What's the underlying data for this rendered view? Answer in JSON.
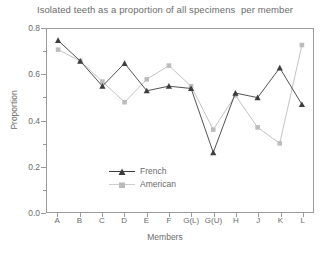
{
  "chart_data": {
    "type": "line",
    "title": "Isolated teeth as a proportion of all specimens  per member",
    "xlabel": "Members",
    "ylabel": "Proportion",
    "categories": [
      "A",
      "B",
      "C",
      "D",
      "E",
      "F",
      "G(L)",
      "G(U)",
      "H",
      "J",
      "K",
      "L"
    ],
    "ylim": [
      0.0,
      0.8
    ],
    "yticks": [
      0.0,
      0.2,
      0.4,
      0.6,
      0.8
    ],
    "ytick_labels": [
      "0.0",
      "0.2",
      "0.4",
      "0.6",
      "0.8"
    ],
    "yminor_ticks": [
      0.1,
      0.3,
      0.5,
      0.7
    ],
    "grid": false,
    "legend_position": "center-left inside plot",
    "series": [
      {
        "name": "French",
        "color": "#3d3d3d",
        "marker": "triangle",
        "values": [
          0.75,
          0.66,
          0.55,
          0.65,
          0.53,
          0.55,
          0.54,
          0.26,
          0.52,
          0.5,
          0.63,
          0.47
        ]
      },
      {
        "name": "American",
        "color": "#bcbcbc",
        "marker": "square",
        "values": [
          0.71,
          0.66,
          0.57,
          0.48,
          0.58,
          0.64,
          0.55,
          0.36,
          0.51,
          0.37,
          0.3,
          0.73
        ]
      }
    ]
  },
  "legend": {
    "items": [
      {
        "label": "French"
      },
      {
        "label": "American"
      }
    ]
  },
  "colors": {
    "french": "#3d3d3d",
    "american": "#bcbcbc",
    "axis": "#9a9a9a",
    "text": "#6b6b6b",
    "background": "#ffffff"
  }
}
